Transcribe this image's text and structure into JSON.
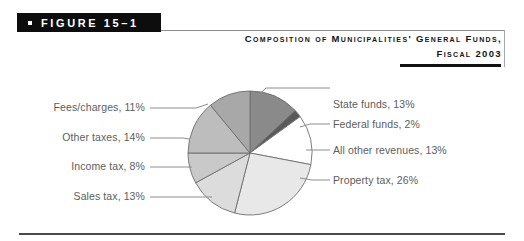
{
  "figure": {
    "bullet_icon": "square-bullet-icon",
    "label": "FIGURE 15–1"
  },
  "title": {
    "line1": "Composition of Municipalities' General Funds,",
    "line2": "Fiscal 2003"
  },
  "colors": {
    "tag_background": "#0d0d0d",
    "tag_text": "#ffffff",
    "label_text": "#5d5d5d",
    "title_text": "#141414",
    "slice_outline": "#6e6e6e",
    "rule": "#4a4a4a"
  },
  "chart_data": {
    "type": "pie",
    "title": "Composition of Municipalities' General Funds, Fiscal 2003",
    "unit": "%",
    "start_angle_deg": 0,
    "direction": "clockwise",
    "legend": "none",
    "labels_position": "outside-with-leader-lines",
    "categories": [
      "State funds",
      "Federal funds",
      "All other revenues",
      "Property tax",
      "Sales tax",
      "Income tax",
      "Other taxes",
      "Fees/charges"
    ],
    "values": [
      13,
      2,
      13,
      26,
      13,
      8,
      14,
      11
    ],
    "slices": [
      {
        "name": "State funds",
        "value": 13,
        "label": "State funds, 13%",
        "color": "#8a8a8a",
        "side": "right"
      },
      {
        "name": "Federal funds",
        "value": 2,
        "label": "Federal funds, 2%",
        "color": "#5a5a5a",
        "side": "right"
      },
      {
        "name": "All other revenues",
        "value": 13,
        "label": "All other revenues, 13%",
        "color": "#ffffff",
        "side": "right"
      },
      {
        "name": "Property tax",
        "value": 26,
        "label": "Property tax, 26%",
        "color": "#e8e8e8",
        "side": "right"
      },
      {
        "name": "Sales tax",
        "value": 13,
        "label": "Sales tax, 13%",
        "color": "#dcdcdc",
        "side": "left"
      },
      {
        "name": "Income tax",
        "value": 8,
        "label": "Income tax, 8%",
        "color": "#c9c9c9",
        "side": "left"
      },
      {
        "name": "Other taxes",
        "value": 14,
        "label": "Other taxes, 14%",
        "color": "#bdbdbd",
        "side": "left"
      },
      {
        "name": "Fees/charges",
        "value": 11,
        "label": "Fees/charges, 11%",
        "color": "#a8a8a8",
        "side": "left"
      }
    ]
  }
}
